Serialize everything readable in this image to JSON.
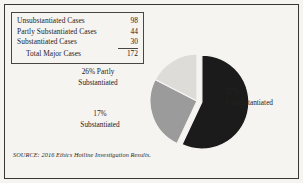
{
  "figure": {
    "background_color": "#f6f4f1",
    "frame_color": "#3a3631"
  },
  "summary_table": {
    "rows": [
      {
        "label": "Unsubstantiated Cases",
        "value": "98"
      },
      {
        "label": "Partly Substantiated Cases",
        "value": "44"
      },
      {
        "label": "Substantiated Cases",
        "value": "30"
      },
      {
        "label": "Total Major Cases",
        "value": "172"
      }
    ]
  },
  "callouts": {
    "partly": {
      "line1": "26% Partly",
      "line2": "Substantiated"
    },
    "substantiated": {
      "line1": "17%",
      "line2": "Substantiated"
    },
    "unsubstantiated": {
      "line1": "57%",
      "line2": "Unsubstantiated"
    }
  },
  "source": {
    "text": "SOURCE: 2016 Ethics Hotline Investigation Results."
  },
  "chart_data": {
    "type": "pie",
    "title": "",
    "categories": [
      "Unsubstantiated",
      "Partly Substantiated",
      "Substantiated"
    ],
    "values": [
      98,
      44,
      30
    ],
    "percentages": [
      57,
      26,
      17
    ],
    "total": 172,
    "colors": [
      "#1b1b1b",
      "#9b9b9b",
      "#dedcd9"
    ],
    "slice_edge_color": "#f6f4f1",
    "exploded": [
      "Unsubstantiated"
    ],
    "explode_offset_px": 5,
    "start_angle_deg": -90,
    "direction": "clockwise",
    "center_px": [
      57,
      55
    ],
    "radius_px": 47,
    "legend": "none",
    "grid": false,
    "data_labels": [
      "57% Unsubstantiated",
      "26% Partly Substantiated",
      "17% Substantiated"
    ]
  }
}
